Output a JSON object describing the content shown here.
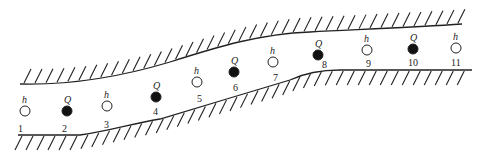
{
  "diagram": {
    "type": "aquifer-cross-section-wells",
    "legend": {
      "h_symbol": "h",
      "q_symbol": "Q",
      "h_meaning": "observation well (open circle)",
      "q_meaning": "pumping well (filled circle)"
    },
    "colors": {
      "line": "#222222",
      "fill_q": "#111111",
      "fill_h": "#ffffff"
    },
    "wells": [
      {
        "id": "1",
        "kind": "h",
        "x": 25,
        "y": 111,
        "label": "1",
        "label_x": 18,
        "label_y": 132,
        "sym": "h"
      },
      {
        "id": "2",
        "kind": "Q",
        "x": 67,
        "y": 111,
        "label": "2",
        "label_x": 62,
        "label_y": 132,
        "sym": "Q"
      },
      {
        "id": "3",
        "kind": "h",
        "x": 107,
        "y": 106,
        "label": "3",
        "label_x": 104,
        "label_y": 128,
        "sym": "h"
      },
      {
        "id": "4",
        "kind": "Q",
        "x": 156,
        "y": 97,
        "label": "4",
        "label_x": 153,
        "label_y": 115,
        "sym": "Q"
      },
      {
        "id": "5",
        "kind": "h",
        "x": 197,
        "y": 82,
        "label": "5",
        "label_x": 197,
        "label_y": 102,
        "sym": "h"
      },
      {
        "id": "6",
        "kind": "Q",
        "x": 234,
        "y": 72,
        "label": "6",
        "label_x": 233,
        "label_y": 91,
        "sym": "Q"
      },
      {
        "id": "7",
        "kind": "h",
        "x": 273,
        "y": 62,
        "label": "7",
        "label_x": 273,
        "label_y": 81,
        "sym": "h"
      },
      {
        "id": "8",
        "kind": "Q",
        "x": 318,
        "y": 55,
        "label": "8",
        "label_x": 322,
        "label_y": 68,
        "sym": "Q"
      },
      {
        "id": "9",
        "kind": "h",
        "x": 367,
        "y": 50,
        "label": "9",
        "label_x": 366,
        "label_y": 67,
        "sym": "h"
      },
      {
        "id": "10",
        "kind": "Q",
        "x": 413,
        "y": 49,
        "label": "10",
        "label_x": 408,
        "label_y": 66,
        "sym": "Q"
      },
      {
        "id": "11",
        "kind": "h",
        "x": 456,
        "y": 48,
        "label": "11",
        "label_x": 451,
        "label_y": 66,
        "sym": "h"
      }
    ]
  }
}
